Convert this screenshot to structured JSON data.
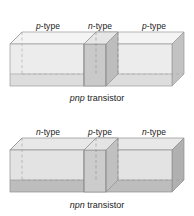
{
  "figures": [
    {
      "id": "pnp",
      "caption_italic": "pnp",
      "caption_rest": " transistor",
      "caption_full": "pnp transistor",
      "segments": [
        {
          "type_italic": "p",
          "type_rest": "-type",
          "label": "p-type",
          "region": "emitter"
        },
        {
          "type_italic": "n",
          "type_rest": "-type",
          "label": "n-type",
          "region": "base"
        },
        {
          "type_italic": "p",
          "type_rest": "-type",
          "label": "p-type",
          "region": "collector"
        }
      ]
    },
    {
      "id": "npn",
      "caption_italic": "npn",
      "caption_rest": " transistor",
      "caption_full": "npn transistor",
      "segments": [
        {
          "type_italic": "n",
          "type_rest": "-type",
          "label": "n-type",
          "region": "emitter"
        },
        {
          "type_italic": "p",
          "type_rest": "-type",
          "label": "p-type",
          "region": "base"
        },
        {
          "type_italic": "n",
          "type_rest": "-type",
          "label": "n-type",
          "region": "collector"
        }
      ]
    }
  ],
  "colors": {
    "background": "#ffffff",
    "front_face_light": "#ebebeb",
    "front_face_band": "#c9c9c9",
    "top_face": "#f2f2f2",
    "side_face": "#b4b4b4",
    "slab_face": "#c4c4c4",
    "slab_face_dark": "#b0b0b0",
    "edge": "#8c8c8c",
    "hidden_edge": "#9a9a9a",
    "text": "#1a1a1a"
  }
}
